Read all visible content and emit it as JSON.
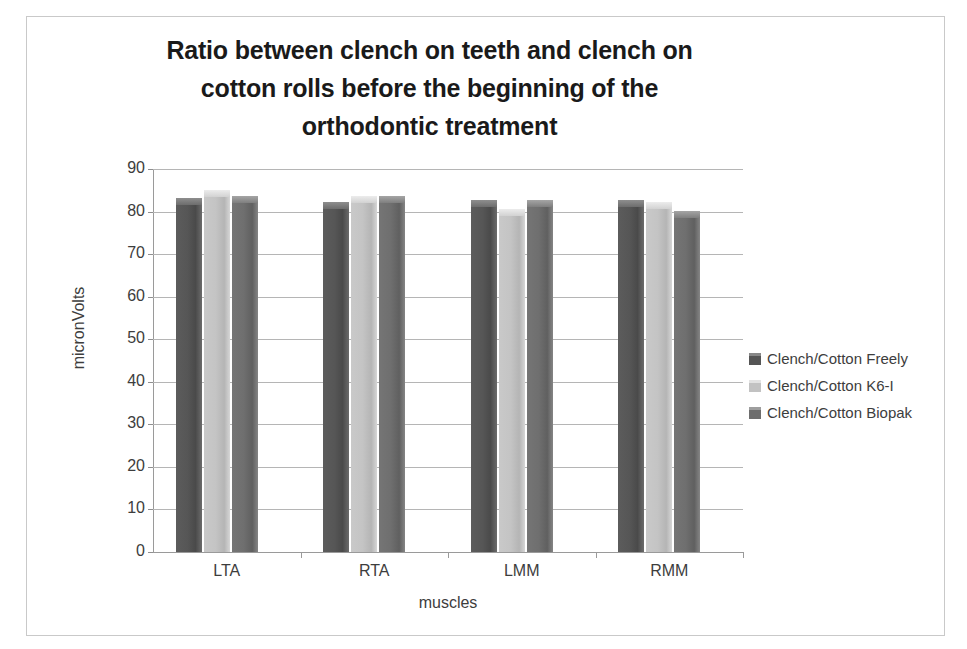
{
  "chart_data": {
    "type": "bar",
    "title": "Ratio between clench on teeth and clench on cotton rolls before the beginning of the orthodontic treatment",
    "title_lines": [
      "Ratio between clench on teeth and clench on",
      "cotton rolls before the beginning of the",
      "orthodontic treatment"
    ],
    "xlabel": "muscles",
    "ylabel": "micronVolts",
    "categories": [
      "LTA",
      "RTA",
      "LMM",
      "RMM"
    ],
    "ylim": [
      0,
      90
    ],
    "yticks": [
      0,
      10,
      20,
      30,
      40,
      50,
      60,
      70,
      80,
      90
    ],
    "ytick_labels": [
      "0",
      "10",
      "20",
      "30",
      "40",
      "50",
      "60",
      "70",
      "80",
      "90"
    ],
    "grid": true,
    "legend_position": "right",
    "series": [
      {
        "name": "Clench/Cotton Freely",
        "color": "#565656",
        "values": [
          81.5,
          80.5,
          81.0,
          81.0
        ]
      },
      {
        "name": "Clench/Cotton K6-I",
        "color": "#c4c4c4",
        "values": [
          83.5,
          82.0,
          79.0,
          80.5
        ]
      },
      {
        "name": "Clench/Cotton Biopak",
        "color": "#6f6f6f",
        "values": [
          82.0,
          82.0,
          81.0,
          78.5
        ]
      }
    ]
  },
  "legend": {
    "items": [
      {
        "label": "Clench/Cotton Freely",
        "swatch": "legend-swatch-series-0"
      },
      {
        "label": "Clench/Cotton K6-I",
        "swatch": "legend-swatch-series-1"
      },
      {
        "label": "Clench/Cotton Biopak",
        "swatch": "legend-swatch-series-2"
      }
    ]
  }
}
